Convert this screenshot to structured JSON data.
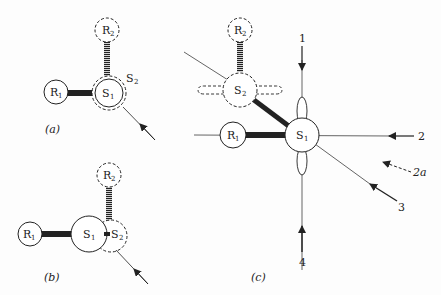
{
  "figure": {
    "panels": [
      {
        "id": "a",
        "caption": "(a)",
        "atoms": [
          {
            "label": "R",
            "sub": "1",
            "style": "solid"
          },
          {
            "label": "R",
            "sub": "2",
            "style": "dashed"
          },
          {
            "label": "S",
            "sub": "1",
            "style": "solid"
          },
          {
            "label": "S",
            "sub": "2",
            "style": "dashed"
          }
        ]
      },
      {
        "id": "b",
        "caption": "(b)",
        "atoms": [
          {
            "label": "R",
            "sub": "1",
            "style": "solid"
          },
          {
            "label": "R",
            "sub": "2",
            "style": "dashed"
          },
          {
            "label": "S",
            "sub": "1",
            "style": "solid"
          },
          {
            "label": "S",
            "sub": "2",
            "style": "dashed"
          }
        ]
      },
      {
        "id": "c",
        "caption": "(c)",
        "atoms": [
          {
            "label": "R",
            "sub": "1",
            "style": "solid"
          },
          {
            "label": "R",
            "sub": "2",
            "style": "dashed"
          },
          {
            "label": "S",
            "sub": "1",
            "style": "solid"
          },
          {
            "label": "S",
            "sub": "2",
            "style": "dashed"
          }
        ],
        "arrows": [
          "1",
          "2",
          "2a",
          "3",
          "4"
        ]
      }
    ]
  }
}
